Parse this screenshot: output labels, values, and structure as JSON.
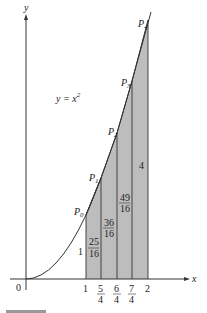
{
  "figure": {
    "curve_label": "y = x",
    "curve_exponent": "2",
    "axes": {
      "x_label": "x",
      "y_label": "y",
      "origin_label": "0"
    },
    "x_ticks": [
      {
        "num": "1",
        "den": ""
      },
      {
        "num": "5",
        "den": "4"
      },
      {
        "num": "6",
        "den": "4"
      },
      {
        "num": "7",
        "den": "4"
      },
      {
        "num": "2",
        "den": ""
      }
    ],
    "points": [
      {
        "name": "P",
        "sub": "0"
      },
      {
        "name": "P",
        "sub": "1"
      },
      {
        "name": "P",
        "sub": "2"
      },
      {
        "name": "P",
        "sub": "3"
      },
      {
        "name": "P",
        "sub": "4"
      }
    ],
    "heights": [
      {
        "num": "25",
        "den": "16"
      },
      {
        "num": "36",
        "den": "16"
      },
      {
        "num": "49",
        "den": "16"
      },
      {
        "value": "4"
      }
    ],
    "left_height": "1",
    "colors": {
      "shade": "#b9b9b9",
      "line": "#333333"
    }
  }
}
